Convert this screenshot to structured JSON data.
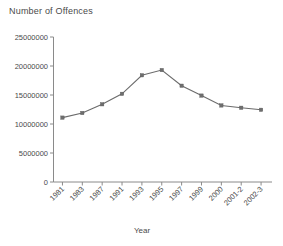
{
  "chart_data": {
    "type": "line",
    "title": "Number of Offences",
    "xlabel": "Year",
    "ylabel": "",
    "categories": [
      "1981",
      "1983",
      "1987",
      "1991",
      "1993",
      "1995",
      "1997",
      "1999",
      "2000",
      "2001-2",
      "2002-3"
    ],
    "values": [
      11100000,
      11900000,
      13400000,
      15200000,
      18400000,
      19300000,
      16600000,
      14900000,
      13200000,
      12800000,
      12450000
    ],
    "series": [
      {
        "name": "Number of Offences",
        "values": [
          11100000,
          11900000,
          13400000,
          15200000,
          18400000,
          19300000,
          16600000,
          14900000,
          13200000,
          12800000,
          12450000
        ]
      }
    ],
    "ylim": [
      0,
      25000000
    ],
    "ytick_labels": [
      "0",
      "5000000",
      "10000000",
      "15000000",
      "20000000",
      "25000000"
    ],
    "ytick_values": [
      0,
      5000000,
      10000000,
      15000000,
      20000000,
      25000000
    ],
    "grid": false,
    "legend": false,
    "marker": "square",
    "line_color": "#6b6b6b",
    "marker_color": "#6e6e6e",
    "axis_color": "#8a8a8a",
    "xtick_label_rotation": -45
  }
}
